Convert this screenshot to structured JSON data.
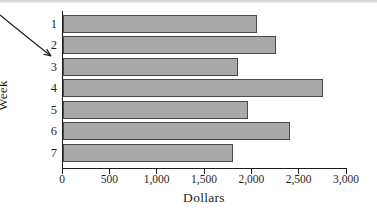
{
  "chart_data": {
    "type": "bar",
    "orientation": "horizontal",
    "title": "",
    "categories": [
      "1",
      "2",
      "3",
      "4",
      "5",
      "6",
      "7"
    ],
    "values": [
      2050,
      2250,
      1850,
      2750,
      1950,
      2400,
      1800
    ],
    "xlabel": "Dollars",
    "ylabel": "Week",
    "xlim": [
      0,
      3000
    ],
    "xticks": [
      0,
      500,
      1000,
      1500,
      2000,
      2500,
      3000
    ],
    "xtick_labels": [
      "0",
      "500",
      "1,000",
      "1,500",
      "2,000",
      "2,500",
      "3,000"
    ],
    "grid": false,
    "legend": "none",
    "bar_color": "#a9a9a9",
    "bar_border_color": "#4a4a4a",
    "axis_color": "#1c1c1c",
    "text_color": "#1f1f1f"
  },
  "annotation": {
    "arrow_color": "#1c1c1c",
    "arrow_points_at": "y-axis between week 2 and week 3"
  }
}
